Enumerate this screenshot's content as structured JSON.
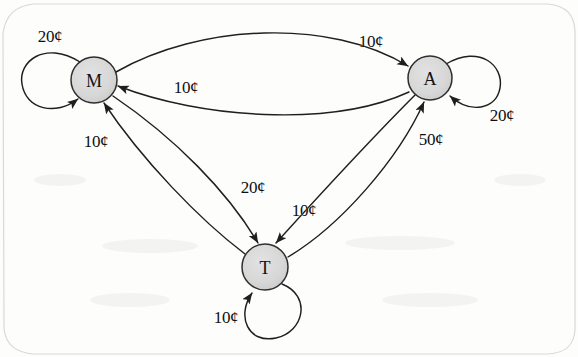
{
  "diagram": {
    "type": "directed-graph",
    "canvas": {
      "width": 578,
      "height": 357
    },
    "style": {
      "node_fill": "#d6d6d6",
      "node_stroke": "#333333",
      "edge_stroke": "#1f1f1f",
      "background": "#fdfdfc",
      "label_color": "#0e0e0e"
    },
    "nodes": [
      {
        "id": "M",
        "label": "M",
        "cx": 94,
        "cy": 80,
        "r": 23
      },
      {
        "id": "A",
        "label": "A",
        "cx": 430,
        "cy": 78,
        "r": 22
      },
      {
        "id": "T",
        "label": "T",
        "cx": 265,
        "cy": 267,
        "r": 23
      }
    ],
    "self_loops": [
      {
        "id": "loop-M",
        "node": "M",
        "label": "20¢",
        "label_x": 50,
        "label_y": 37,
        "cx": 52,
        "cy": 82,
        "r": 30
      },
      {
        "id": "loop-A",
        "node": "A",
        "label": "20¢",
        "label_x": 502,
        "label_y": 116,
        "cx": 473,
        "cy": 78,
        "r": 28
      },
      {
        "id": "loop-T",
        "node": "T",
        "label": "10¢",
        "label_x": 226,
        "label_y": 318,
        "cx": 272,
        "cy": 298,
        "r": 28
      }
    ],
    "edges": [
      {
        "id": "edge-M-A",
        "from": "M",
        "to": "A",
        "label": "10¢",
        "label_x": 371,
        "label_y": 42
      },
      {
        "id": "edge-A-M",
        "from": "A",
        "to": "M",
        "label": "10¢",
        "label_x": 186,
        "label_y": 88
      },
      {
        "id": "edge-M-T",
        "from": "M",
        "to": "T",
        "label": "20¢",
        "label_x": 253,
        "label_y": 188
      },
      {
        "id": "edge-T-M",
        "from": "T",
        "to": "M",
        "label": "10¢",
        "label_x": 96,
        "label_y": 142
      },
      {
        "id": "edge-A-T",
        "from": "A",
        "to": "T",
        "label": "10¢",
        "label_x": 304,
        "label_y": 211
      },
      {
        "id": "edge-T-A",
        "from": "T",
        "to": "A",
        "label": "50¢",
        "label_x": 431,
        "label_y": 140
      }
    ]
  }
}
